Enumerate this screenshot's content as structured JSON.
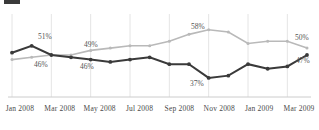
{
  "chart_data": {
    "type": "line",
    "title": "",
    "subtitle": "",
    "xlabel": "",
    "ylabel": "",
    "ylim": [
      30,
      64
    ],
    "grid": "vertical",
    "legend_position": "none",
    "x": [
      "Jan 2008",
      "Feb 2008",
      "Mar 2008",
      "Apr 2008",
      "May 2008",
      "Jun 2008",
      "Jul 2008",
      "Aug 2008",
      "Sep 2008",
      "Oct 2008",
      "Nov 2008",
      "Dec 2008",
      "Jan 2009",
      "Feb 2009",
      "Mar 2009",
      "Apr 2009"
    ],
    "tick_labels": [
      "Jan 2008",
      "Mar 2008",
      "May 2008",
      "Jul 2008",
      "Sep 2008",
      "Nov 2008",
      "Jan 2009",
      "Mar 2009"
    ],
    "series": [
      {
        "name": "dark-series",
        "color": "#3a3a3a",
        "values": [
          48,
          51,
          47,
          46,
          45,
          44,
          45,
          46,
          43,
          43,
          37,
          38,
          43,
          41,
          42,
          47
        ],
        "annotations": [
          {
            "index": 1,
            "text": "51%",
            "position": "above"
          },
          {
            "index": 3,
            "text": "46%",
            "position": "below"
          },
          {
            "index": 10,
            "text": "37%",
            "position": "below"
          },
          {
            "index": 15,
            "text": "47%",
            "position": "right"
          }
        ]
      },
      {
        "name": "light-series",
        "color": "#b9b9b9",
        "values": [
          45,
          46,
          47,
          47,
          49,
          50,
          51,
          51,
          53,
          56,
          58,
          57,
          52,
          53,
          53,
          50
        ],
        "annotations": [
          {
            "index": 1,
            "text": "46%",
            "position": "below"
          },
          {
            "index": 4,
            "text": "49%",
            "position": "above"
          },
          {
            "index": 10,
            "text": "58%",
            "position": "above"
          },
          {
            "index": 15,
            "text": "50%",
            "position": "right"
          }
        ]
      }
    ]
  },
  "annotations": {
    "dark_51": "51%",
    "dark_46": "46%",
    "dark_37": "37%",
    "dark_47": "47%",
    "light_46": "46%",
    "light_49": "49%",
    "light_58": "58%",
    "light_50": "50%"
  },
  "axis": {
    "ticks": [
      "Jan 2008",
      "Mar 2008",
      "May 2008",
      "Jul 2008",
      "Sep 2008",
      "Nov 2008",
      "Jan 2009",
      "Mar 2009"
    ]
  }
}
